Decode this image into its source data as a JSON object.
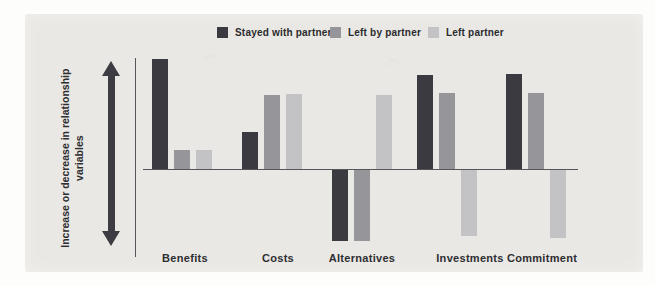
{
  "figure": {
    "background_color": "#e9e8e4",
    "page_background": "#fdfdfc"
  },
  "chart_data": {
    "type": "bar",
    "title": "",
    "categories": [
      "Benefits",
      "Costs",
      "Alternatives",
      "Investments",
      "Commitment"
    ],
    "series": [
      {
        "name": "Stayed with partner",
        "color": "#3a3a40",
        "values": [
          110,
          37,
          -71,
          94,
          95
        ]
      },
      {
        "name": "Left by partner",
        "color": "#95959a",
        "values": [
          19,
          74,
          -71,
          76,
          76
        ]
      },
      {
        "name": "Left partner",
        "color": "#c3c3c6",
        "values": [
          19,
          75,
          74,
          -66,
          -68
        ]
      }
    ],
    "ylabel": "Increase or decrease in relationship variables",
    "xlabel": "",
    "value_units": "relative magnitude (qualitative chart, no numeric axis shown)",
    "baseline": 0,
    "ylim": [
      -80,
      115
    ],
    "grid": false,
    "axis_ticks": false,
    "legend_position": "top",
    "y_axis_arrow": "double-headed"
  }
}
